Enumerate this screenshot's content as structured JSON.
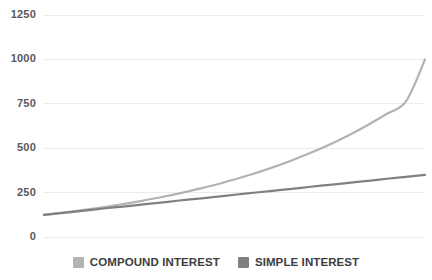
{
  "chart_data": {
    "type": "line",
    "title": "",
    "xlabel": "",
    "ylabel": "",
    "ylim": [
      0,
      1250
    ],
    "y_ticks": [
      1250,
      1000,
      750,
      500,
      250,
      0
    ],
    "y_tick_labels": [
      "1250",
      "1000",
      "750",
      "500",
      "250",
      "0"
    ],
    "grid": true,
    "grid_color": "#ececec",
    "legend_position": "bottom-center",
    "x": [
      0,
      1,
      2,
      3,
      4,
      5,
      6,
      7,
      8,
      9,
      10,
      11,
      12,
      13,
      14,
      15,
      16,
      17,
      18,
      19,
      20
    ],
    "series": [
      {
        "name": "COMPOUND INTEREST",
        "color": "#b3b3b3",
        "values": [
          125,
          138,
          151,
          166,
          183,
          201,
          221,
          243,
          268,
          294,
          324,
          356,
          392,
          431,
          474,
          521,
          573,
          631,
          694,
          763,
          1000
        ]
      },
      {
        "name": "SIMPLE INTEREST",
        "color": "#808080",
        "values": [
          125,
          136,
          147,
          159,
          170,
          181,
          192,
          204,
          215,
          226,
          238,
          249,
          260,
          271,
          283,
          294,
          305,
          316,
          328,
          339,
          350
        ]
      }
    ]
  },
  "legend": {
    "items": [
      {
        "label": "COMPOUND INTEREST",
        "color": "#b3b3b3",
        "swatch_name": "compound-interest-swatch"
      },
      {
        "label": "SIMPLE INTEREST",
        "color": "#808080",
        "swatch_name": "simple-interest-swatch"
      }
    ]
  },
  "colors": {
    "background": "#ffffff",
    "grid": "#ececec",
    "tick_text": "#595959",
    "legend_text": "#3d3d3d",
    "compound": "#b3b3b3",
    "simple": "#808080"
  }
}
